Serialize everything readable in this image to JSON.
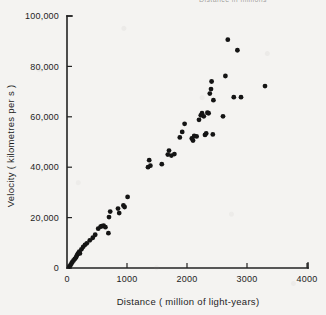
{
  "figure": {
    "clipped_header_text": "Distance in millions",
    "background_color": "#f4f3f1",
    "ink_color": "#141414"
  },
  "chart_data": {
    "type": "scatter",
    "title": "",
    "xlabel": "Distance ( million of light-years)",
    "ylabel": "Velocity ( kilometres  per  s )",
    "xlim": [
      0,
      4000
    ],
    "ylim": [
      0,
      100000
    ],
    "grid": false,
    "legend": null,
    "xticks": [
      0,
      1000,
      2000,
      3000,
      4000
    ],
    "xtick_labels": [
      "0",
      "1000",
      "2000",
      "3000",
      "4000"
    ],
    "yticks": [
      0,
      20000,
      40000,
      60000,
      80000,
      100000
    ],
    "ytick_labels": [
      "0",
      "20,000",
      "40,000",
      "60,000",
      "80,000",
      "100,000"
    ],
    "marker": "filled-circle",
    "marker_color": "#141414",
    "marker_size_px": 2.4,
    "points": [
      [
        40,
        600
      ],
      [
        60,
        1200
      ],
      [
        75,
        1800
      ],
      [
        90,
        2400
      ],
      [
        110,
        3000
      ],
      [
        130,
        3600
      ],
      [
        150,
        4200
      ],
      [
        165,
        5000
      ],
      [
        180,
        5600
      ],
      [
        195,
        6000
      ],
      [
        205,
        6500
      ],
      [
        215,
        5800
      ],
      [
        240,
        7400
      ],
      [
        270,
        8400
      ],
      [
        300,
        9200
      ],
      [
        330,
        9800
      ],
      [
        380,
        11000
      ],
      [
        430,
        12000
      ],
      [
        470,
        13200
      ],
      [
        520,
        15600
      ],
      [
        560,
        16400
      ],
      [
        580,
        16600
      ],
      [
        610,
        16800
      ],
      [
        640,
        16200
      ],
      [
        690,
        13800
      ],
      [
        700,
        20200
      ],
      [
        720,
        22400
      ],
      [
        850,
        23600
      ],
      [
        870,
        21800
      ],
      [
        940,
        24800
      ],
      [
        960,
        24200
      ],
      [
        1010,
        28200
      ],
      [
        1350,
        40000
      ],
      [
        1370,
        42800
      ],
      [
        1390,
        40600
      ],
      [
        1580,
        41200
      ],
      [
        1680,
        45000
      ],
      [
        1700,
        46600
      ],
      [
        1740,
        44600
      ],
      [
        1790,
        45200
      ],
      [
        1880,
        51800
      ],
      [
        1920,
        54000
      ],
      [
        1960,
        57200
      ],
      [
        2080,
        51400
      ],
      [
        2100,
        50600
      ],
      [
        2120,
        52400
      ],
      [
        2160,
        52200
      ],
      [
        2200,
        58800
      ],
      [
        2230,
        60600
      ],
      [
        2250,
        61400
      ],
      [
        2280,
        60200
      ],
      [
        2300,
        52800
      ],
      [
        2320,
        53400
      ],
      [
        2340,
        61600
      ],
      [
        2360,
        61400
      ],
      [
        2380,
        69200
      ],
      [
        2400,
        71000
      ],
      [
        2410,
        74000
      ],
      [
        2430,
        53000
      ],
      [
        2440,
        66600
      ],
      [
        2600,
        60200
      ],
      [
        2640,
        76200
      ],
      [
        2680,
        90600
      ],
      [
        2780,
        67800
      ],
      [
        2840,
        86400
      ],
      [
        2900,
        67800
      ],
      [
        3300,
        72200
      ]
    ]
  }
}
